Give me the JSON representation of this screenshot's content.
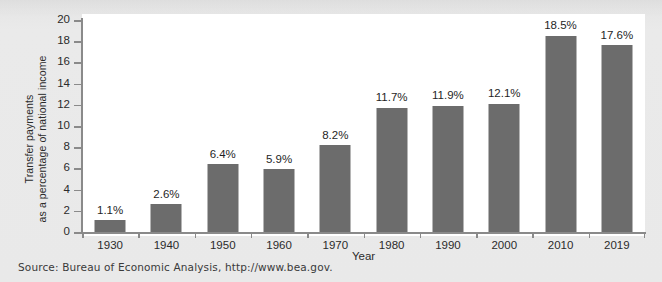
{
  "source_note": "Source: Bureau of Economic Analysis, http://www.bea.gov.",
  "colors": {
    "bar": "#6c6c6c",
    "axis": "#8a8a8a",
    "plot_background": "#ffffff",
    "page_background": "#e9e9e9",
    "text": "#2b2b2b"
  },
  "y_axis_title_line1": "Transfer payments",
  "y_axis_title_line2": "as a percentage of national income",
  "chart_data": {
    "type": "bar",
    "title": "",
    "subtitle": "",
    "xlabel": "Year",
    "ylabel": "Transfer payments as a percentage of national income",
    "categories": [
      "1930",
      "1940",
      "1950",
      "1960",
      "1970",
      "1980",
      "1990",
      "2000",
      "2010",
      "2019"
    ],
    "values": [
      1.1,
      2.6,
      6.4,
      5.9,
      8.2,
      11.7,
      11.9,
      12.1,
      18.5,
      17.6
    ],
    "data_labels": [
      "1.1%",
      "2.6%",
      "6.4%",
      "5.9%",
      "8.2%",
      "11.7%",
      "11.9%",
      "12.1%",
      "18.5%",
      "17.6%"
    ],
    "ylim": [
      0,
      20
    ],
    "ytick_step": 2,
    "ytick_labels": [
      "0",
      "2",
      "4",
      "6",
      "8",
      "10",
      "12",
      "14",
      "16",
      "18",
      "20"
    ],
    "grid": false,
    "legend": null,
    "legend_position": "none",
    "series": [
      {
        "name": "Transfer payments as a percentage of national income",
        "values": [
          1.1,
          2.6,
          6.4,
          5.9,
          8.2,
          11.7,
          11.9,
          12.1,
          18.5,
          17.6
        ]
      }
    ]
  }
}
